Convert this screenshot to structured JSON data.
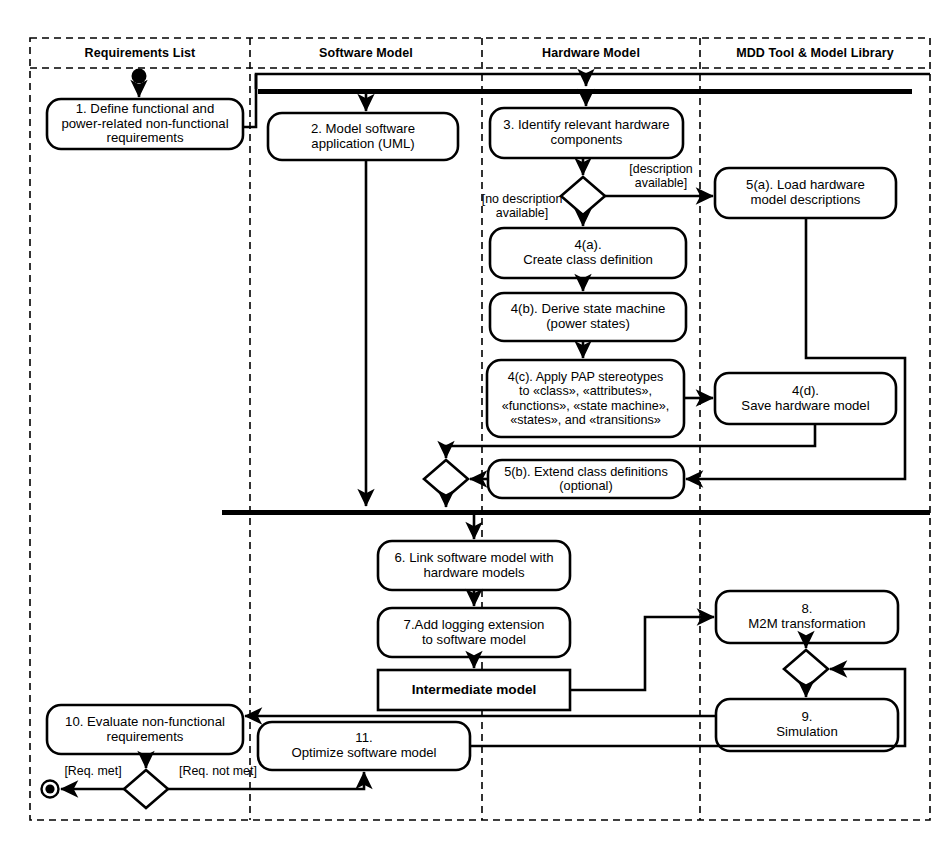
{
  "diagram": {
    "type": "uml-activity-diagram",
    "stroke_color": "#000000",
    "background_color": "#ffffff"
  },
  "lanes": [
    {
      "id": "requirements",
      "label": "Requirements List"
    },
    {
      "id": "software",
      "label": "Software Model"
    },
    {
      "id": "hardware",
      "label": "Hardware Model"
    },
    {
      "id": "mdd",
      "label": "MDD Tool & Model Library"
    }
  ],
  "nodes": {
    "start": {
      "kind": "initial-node",
      "label": ""
    },
    "n1": {
      "kind": "action",
      "lane": "requirements",
      "label": "1. Define functional and power-related non-functional requirements"
    },
    "n2": {
      "kind": "action",
      "lane": "software",
      "label": "2. Model software application (UML)"
    },
    "n3": {
      "kind": "action",
      "lane": "hardware",
      "label": "3. Identify relevant hardware components"
    },
    "d1": {
      "kind": "decision",
      "lane": "hardware",
      "label": ""
    },
    "n4a": {
      "kind": "action",
      "lane": "hardware",
      "label": "4(a). Create class definition"
    },
    "n4b": {
      "kind": "action",
      "lane": "hardware",
      "label": "4(b). Derive state machine (power states)"
    },
    "n4c": {
      "kind": "action",
      "lane": "hardware",
      "label": "4(c). Apply PAP stereotypes to «class», «attributes», «functions», «state machine», «states», and «transitions»"
    },
    "n4d": {
      "kind": "action",
      "lane": "mdd",
      "label": "4(d). Save hardware model"
    },
    "n5a": {
      "kind": "action",
      "lane": "mdd",
      "label": "5(a). Load hardware model descriptions"
    },
    "m1": {
      "kind": "merge",
      "lane": "hardware",
      "label": ""
    },
    "n5b": {
      "kind": "action",
      "lane": "hardware",
      "label": "5(b). Extend class definitions (optional)"
    },
    "n6": {
      "kind": "action",
      "lane": "hardware",
      "label": "6. Link software model with hardware models"
    },
    "n7": {
      "kind": "action",
      "lane": "hardware",
      "label": "7.Add logging extension to software model"
    },
    "intermediate": {
      "kind": "object",
      "lane": "hardware",
      "label": "Intermediate model"
    },
    "n8": {
      "kind": "action",
      "lane": "mdd",
      "label": "8. M2M transformation"
    },
    "m2": {
      "kind": "merge",
      "lane": "mdd",
      "label": ""
    },
    "n9": {
      "kind": "action",
      "lane": "mdd",
      "label": "9. Simulation"
    },
    "n10": {
      "kind": "action",
      "lane": "requirements",
      "label": "10. Evaluate non-functional requirements"
    },
    "n11": {
      "kind": "action",
      "lane": "software",
      "label": "11. Optimize software model"
    },
    "d2": {
      "kind": "decision",
      "lane": "requirements",
      "label": ""
    },
    "final": {
      "kind": "final-node",
      "label": ""
    }
  },
  "node_label_lines": {
    "n1": [
      "1. Define functional and",
      "power-related non-functional",
      "requirements"
    ],
    "n2": [
      "2. Model software",
      "application (UML)"
    ],
    "n3": [
      "3. Identify relevant hardware",
      "components"
    ],
    "n4a": [
      "4(a).",
      "Create class definition"
    ],
    "n4b": [
      "4(b). Derive state machine",
      "(power states)"
    ],
    "n4c": [
      "4(c). Apply PAP stereotypes",
      "to «class», «attributes»,",
      "«functions», «state machine»,",
      "«states», and «transitions»"
    ],
    "n4d": [
      "4(d).",
      "Save hardware model"
    ],
    "n5a": [
      "5(a). Load hardware",
      "model descriptions"
    ],
    "n5b": [
      "5(b). Extend class definitions",
      "(optional)"
    ],
    "n6": [
      "6. Link software model with",
      "hardware models"
    ],
    "n7": [
      "7.Add logging extension",
      "to software model"
    ],
    "intermediate": [
      "Intermediate model"
    ],
    "n8": [
      "8.",
      "M2M transformation"
    ],
    "n9": [
      "9.",
      "Simulation"
    ],
    "n10": [
      "10. Evaluate non-functional",
      "requirements"
    ],
    "n11": [
      "11.",
      "Optimize software model"
    ]
  },
  "guards": [
    {
      "id": "guard-description-available",
      "lines": [
        "[description",
        "available]"
      ]
    },
    {
      "id": "guard-no-description-available",
      "lines": [
        "[no description",
        "available]"
      ]
    },
    {
      "id": "guard-req-met",
      "lines": [
        "[Req. met]"
      ]
    },
    {
      "id": "guard-req-not-met",
      "lines": [
        "[Req. not met]"
      ]
    }
  ],
  "bars": [
    {
      "id": "fork-bar-top",
      "kind": "fork"
    },
    {
      "id": "join-bar-middle",
      "kind": "join"
    }
  ]
}
